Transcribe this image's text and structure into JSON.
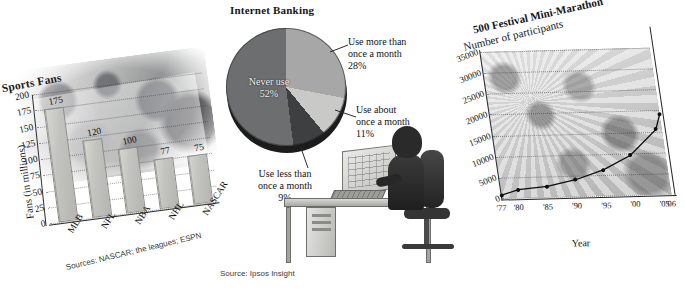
{
  "page": {
    "background": "#ffffff",
    "figure_count": 3
  },
  "chart_data": [
    {
      "id": "sports-fans",
      "type": "bar",
      "title": "Sports Fans",
      "xlabel": "",
      "ylabel": "Fans (in millions)",
      "ylim": [
        0,
        200
      ],
      "yticks": [
        "200",
        "175",
        "150",
        "125",
        "100",
        "75",
        "50",
        "25",
        "0"
      ],
      "grid": true,
      "categories": [
        "MLB",
        "NFL",
        "NBA",
        "NHL",
        "NASCAR"
      ],
      "values": [
        175,
        120,
        100,
        77,
        75
      ],
      "value_labels": [
        "175",
        "120",
        "100",
        "77",
        "75"
      ],
      "source": "Sources: NASCAR; the leagues; ESPN",
      "bar_color": "#c3c3bf",
      "background_image": "sports-fans-photo-collage"
    },
    {
      "id": "internet-banking",
      "type": "pie",
      "title": "Internet Banking",
      "slices": [
        {
          "label": "Use more than once a month",
          "percent": 28,
          "percent_label": "28%",
          "color": "#a6a7a6",
          "label_position": "right-top"
        },
        {
          "label": "Use about once a month",
          "percent": 11,
          "percent_label": "11%",
          "color": "#c9cac8",
          "label_position": "right-bottom"
        },
        {
          "label": "Use less than once a month",
          "percent": 9,
          "percent_label": "9%",
          "color": "#3e3f40",
          "label_position": "bottom"
        },
        {
          "label": "Never use",
          "percent": 52,
          "percent_label": "52%",
          "color": "#6d6e6f",
          "label_position": "inside-left"
        }
      ],
      "source": "Source: Ipsos Insight",
      "illustration": "person-at-computer-desk"
    },
    {
      "id": "mini-marathon",
      "type": "line",
      "title": "500 Festival Mini-Marathon",
      "subtitle": "Number of participants",
      "xlabel": "Year",
      "ylabel": "",
      "ylim": [
        0,
        35000
      ],
      "yticks": [
        "35000",
        "30000",
        "25000",
        "20000",
        "15000",
        "10000",
        "5000",
        "0"
      ],
      "xticks": [
        "'77",
        "'80",
        "'85",
        "'90",
        "'95",
        "'00",
        "'05",
        "'06"
      ],
      "x": [
        "'77",
        "'80",
        "'85",
        "'90",
        "'95",
        "'00",
        "'05",
        "'06"
      ],
      "values": [
        800,
        2000,
        2600,
        4000,
        6200,
        9500,
        15500,
        19000
      ],
      "grid": true,
      "marker": "filled-circle",
      "line_color": "#0d0d0d",
      "background_image": "crowd-of-runners-photo"
    }
  ],
  "sports": {
    "title": "Sports Fans",
    "ylabel": "Fans (in millions)",
    "source": "Sources: NASCAR; the leagues; ESPN",
    "yticks": [
      "200",
      "175",
      "150",
      "125",
      "100",
      "75",
      "50",
      "25",
      "0"
    ],
    "bars": [
      {
        "cat": "MLB",
        "value": 175,
        "label": "175"
      },
      {
        "cat": "NFL",
        "value": 120,
        "label": "120"
      },
      {
        "cat": "NBA",
        "value": 100,
        "label": "100"
      },
      {
        "cat": "NHL",
        "value": 77,
        "label": "77"
      },
      {
        "cat": "NASCAR",
        "value": 75,
        "label": "75"
      }
    ]
  },
  "banking": {
    "title": "Internet Banking",
    "source": "Source: Ipsos Insight",
    "labels": {
      "more": "Use more than",
      "more2": "once a month",
      "more_pct": "28%",
      "about": "Use about",
      "about2": "once a month",
      "about_pct": "11%",
      "less": "Use less than",
      "less2": "once a month",
      "less_pct": "9%",
      "never": "Never use",
      "never_pct": "52%"
    }
  },
  "marathon": {
    "title": "500 Festival Mini-Marathon",
    "subtitle": "Number of participants",
    "xlabel": "Year",
    "yticks": [
      "35000",
      "30000",
      "25000",
      "20000",
      "15000",
      "10000",
      "5000",
      "0"
    ],
    "xticks": [
      "'77",
      "'80",
      "'85",
      "'90",
      "'95",
      "'00",
      "'05",
      "'06"
    ]
  }
}
